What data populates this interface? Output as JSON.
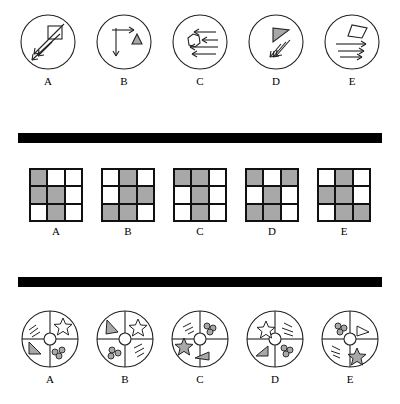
{
  "page": {
    "divider_color": "#000000",
    "shade_color": "#a8a8a8",
    "line_color": "#222222"
  },
  "rows": [
    {
      "name": "arrows-row",
      "labels": [
        "A",
        "B",
        "C",
        "D",
        "E"
      ],
      "items": [
        {
          "label": "A",
          "shape": "square",
          "arrows": 3,
          "arrow_direction": "diagonal-down-left"
        },
        {
          "label": "B",
          "shape": "triangle",
          "arrows": 2,
          "arrow_direction": "down-and-right"
        },
        {
          "label": "C",
          "shape": "heptagon",
          "arrows": 4,
          "arrow_direction": "left"
        },
        {
          "label": "D",
          "shape": "flag-triangle",
          "arrows": 3,
          "arrow_direction": "diagonal-down-left"
        },
        {
          "label": "E",
          "shape": "quadrilateral",
          "arrows": 3,
          "arrow_direction": "right"
        }
      ]
    },
    {
      "name": "grid-row",
      "labels": [
        "A",
        "B",
        "C",
        "D",
        "E"
      ],
      "grids": [
        {
          "label": "A",
          "cells": [
            1,
            0,
            0,
            1,
            1,
            0,
            0,
            1,
            0
          ]
        },
        {
          "label": "B",
          "cells": [
            0,
            1,
            0,
            0,
            1,
            1,
            1,
            1,
            0
          ]
        },
        {
          "label": "C",
          "cells": [
            1,
            1,
            0,
            0,
            1,
            0,
            0,
            1,
            0
          ]
        },
        {
          "label": "D",
          "cells": [
            1,
            0,
            1,
            0,
            1,
            0,
            1,
            1,
            0
          ]
        },
        {
          "label": "E",
          "cells": [
            0,
            1,
            0,
            1,
            1,
            0,
            0,
            1,
            1
          ]
        }
      ]
    },
    {
      "name": "circle-segments-row",
      "labels": [
        "A",
        "B",
        "C",
        "D",
        "E"
      ],
      "items": [
        {
          "label": "A",
          "star_position": "top-right",
          "triangle_position": "left",
          "dots": 3,
          "lines": 3
        },
        {
          "label": "B",
          "star_position": "top-right",
          "triangle_position": "top-left",
          "dots": 3,
          "lines": 3
        },
        {
          "label": "C",
          "star_position": "left",
          "triangle_position": "bottom",
          "dots": 3,
          "lines": 3
        },
        {
          "label": "D",
          "star_position": "top",
          "triangle_position": "bottom-left",
          "dots": 3,
          "lines": 3
        },
        {
          "label": "E",
          "star_position": "bottom",
          "triangle_position": "right",
          "dots": 3,
          "lines": 3
        }
      ]
    }
  ]
}
